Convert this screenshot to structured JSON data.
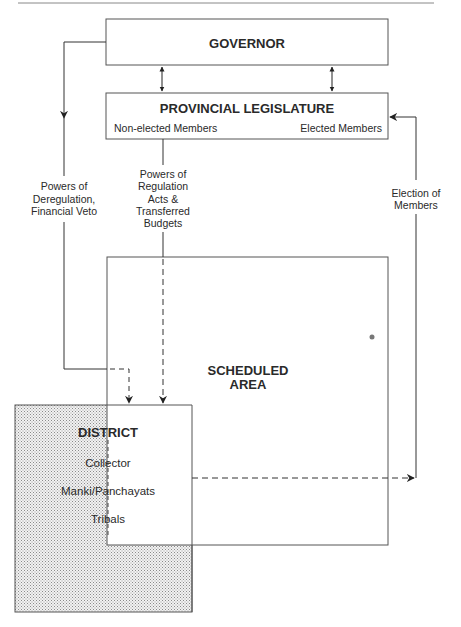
{
  "diagram": {
    "nodes": {
      "governor": {
        "label": "GOVERNOR"
      },
      "legislature": {
        "label": "PROVINCIAL LEGISLATURE",
        "left_sub": "Non-elected Members",
        "right_sub": "Elected Members"
      },
      "scheduled_area": {
        "label_line1": "SCHEDULED",
        "label_line2": "AREA"
      },
      "district": {
        "label": "DISTRICT",
        "hierarchy": [
          "Collector",
          "Manki/Panchayats",
          "Tribals"
        ]
      }
    },
    "edges": {
      "deregulation": {
        "lines": [
          "Powers of",
          "Deregulation,",
          "Financial Veto"
        ]
      },
      "regulation": {
        "lines": [
          "Powers of",
          "Regulation",
          "Acts &",
          "Transferred",
          "Budgets"
        ]
      },
      "election": {
        "lines": [
          "Election of",
          "Members"
        ]
      }
    },
    "colors": {
      "line": "#333333",
      "shade": "#9a9a9a"
    }
  }
}
